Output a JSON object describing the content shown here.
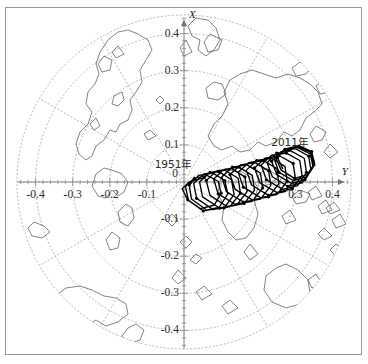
{
  "figure": {
    "type": "polar-motion-plot",
    "background": "#ffffff",
    "frame_color": "#9b9b9b",
    "grid_color": "#b9b9b9",
    "coast_color": "#555555",
    "data_color": "#000000",
    "axis_color": "#8a8a8a"
  },
  "axes": {
    "x_axis_label": "X",
    "y_axis_label": "Y",
    "origin_label": "0",
    "x_ticks_left": [
      "-0.4",
      "-0.3",
      "-0.2",
      "-0.1"
    ],
    "x_ticks_right": [
      "0.3",
      "0.4"
    ],
    "y_ticks_up": [
      "0.4",
      "0.3",
      "0.2",
      "0.1"
    ],
    "y_ticks_down": [
      "-0.1",
      "-0.2",
      "-0.3",
      "-0.4"
    ],
    "xlim": [
      -0.45,
      0.45
    ],
    "ylim": [
      -0.45,
      0.45
    ],
    "grid": "polar-dotted"
  },
  "annotations": [
    {
      "text": "1951年",
      "x": 0.02,
      "y": 0.045
    },
    {
      "text": "2011年",
      "x": 0.235,
      "y": 0.105
    }
  ],
  "chart_data": {
    "type": "line",
    "title": "",
    "xlabel": "X",
    "ylabel": "Y",
    "xlim": [
      -0.45,
      0.45
    ],
    "ylim": [
      -0.45,
      0.45
    ],
    "grid": true,
    "legend": "none",
    "series": [
      {
        "name": "polar motion 1951-2011",
        "start_label": "1951年",
        "end_label": "2011年",
        "points": [
          [
            0.055,
            0.012
          ],
          [
            0.015,
            0.001
          ],
          [
            -0.005,
            -0.018
          ],
          [
            0.01,
            -0.048
          ],
          [
            0.045,
            -0.072
          ],
          [
            0.082,
            -0.062
          ],
          [
            0.1,
            -0.03
          ],
          [
            0.092,
            0.002
          ],
          [
            0.062,
            0.018
          ],
          [
            0.028,
            0.01
          ],
          [
            0.004,
            -0.012
          ],
          [
            0.012,
            -0.05
          ],
          [
            0.052,
            -0.078
          ],
          [
            0.095,
            -0.068
          ],
          [
            0.118,
            -0.032
          ],
          [
            0.11,
            0.004
          ],
          [
            0.078,
            0.024
          ],
          [
            0.04,
            0.018
          ],
          [
            0.014,
            -0.008
          ],
          [
            0.02,
            -0.046
          ],
          [
            0.062,
            -0.076
          ],
          [
            0.108,
            -0.07
          ],
          [
            0.135,
            -0.034
          ],
          [
            0.128,
            0.006
          ],
          [
            0.094,
            0.028
          ],
          [
            0.054,
            0.022
          ],
          [
            0.026,
            -0.004
          ],
          [
            0.034,
            -0.044
          ],
          [
            0.078,
            -0.074
          ],
          [
            0.124,
            -0.066
          ],
          [
            0.152,
            -0.03
          ],
          [
            0.146,
            0.01
          ],
          [
            0.11,
            0.032
          ],
          [
            0.07,
            0.026
          ],
          [
            0.042,
            0.0
          ],
          [
            0.05,
            -0.04
          ],
          [
            0.096,
            -0.07
          ],
          [
            0.142,
            -0.062
          ],
          [
            0.17,
            -0.026
          ],
          [
            0.164,
            0.014
          ],
          [
            0.128,
            0.036
          ],
          [
            0.088,
            0.03
          ],
          [
            0.06,
            0.004
          ],
          [
            0.07,
            -0.036
          ],
          [
            0.116,
            -0.066
          ],
          [
            0.162,
            -0.058
          ],
          [
            0.19,
            -0.022
          ],
          [
            0.184,
            0.018
          ],
          [
            0.148,
            0.04
          ],
          [
            0.108,
            0.034
          ],
          [
            0.08,
            0.008
          ],
          [
            0.092,
            -0.032
          ],
          [
            0.138,
            -0.06
          ],
          [
            0.184,
            -0.052
          ],
          [
            0.212,
            -0.016
          ],
          [
            0.206,
            0.024
          ],
          [
            0.17,
            0.046
          ],
          [
            0.13,
            0.04
          ],
          [
            0.102,
            0.014
          ],
          [
            0.114,
            -0.026
          ],
          [
            0.16,
            -0.054
          ],
          [
            0.206,
            -0.046
          ],
          [
            0.234,
            -0.01
          ],
          [
            0.228,
            0.03
          ],
          [
            0.192,
            0.052
          ],
          [
            0.152,
            0.046
          ],
          [
            0.124,
            0.02
          ],
          [
            0.138,
            -0.02
          ],
          [
            0.184,
            -0.048
          ],
          [
            0.228,
            -0.04
          ],
          [
            0.256,
            -0.004
          ],
          [
            0.25,
            0.036
          ],
          [
            0.214,
            0.058
          ],
          [
            0.174,
            0.052
          ],
          [
            0.146,
            0.026
          ],
          [
            0.16,
            -0.014
          ],
          [
            0.206,
            -0.042
          ],
          [
            0.25,
            -0.034
          ],
          [
            0.278,
            0.002
          ],
          [
            0.272,
            0.042
          ],
          [
            0.236,
            0.064
          ],
          [
            0.196,
            0.058
          ],
          [
            0.168,
            0.032
          ],
          [
            0.182,
            -0.008
          ],
          [
            0.228,
            -0.036
          ],
          [
            0.272,
            -0.026
          ],
          [
            0.3,
            0.01
          ],
          [
            0.294,
            0.05
          ],
          [
            0.258,
            0.07
          ],
          [
            0.218,
            0.064
          ],
          [
            0.19,
            0.038
          ],
          [
            0.204,
            -0.002
          ],
          [
            0.25,
            -0.028
          ],
          [
            0.292,
            -0.018
          ],
          [
            0.318,
            0.018
          ],
          [
            0.312,
            0.058
          ],
          [
            0.276,
            0.078
          ],
          [
            0.236,
            0.072
          ],
          [
            0.208,
            0.046
          ],
          [
            0.222,
            0.006
          ],
          [
            0.266,
            -0.02
          ],
          [
            0.306,
            -0.01
          ],
          [
            0.33,
            0.026
          ],
          [
            0.324,
            0.064
          ],
          [
            0.288,
            0.084
          ],
          [
            0.25,
            0.078
          ],
          [
            0.224,
            0.052
          ],
          [
            0.238,
            0.014
          ],
          [
            0.28,
            -0.012
          ],
          [
            0.318,
            -0.002
          ],
          [
            0.342,
            0.032
          ],
          [
            0.336,
            0.07
          ],
          [
            0.3,
            0.09
          ],
          [
            0.262,
            0.082
          ],
          [
            0.236,
            0.056
          ],
          [
            0.25,
            0.02
          ],
          [
            0.29,
            -0.004
          ],
          [
            0.326,
            0.006
          ],
          [
            0.348,
            0.04
          ],
          [
            0.34,
            0.076
          ],
          [
            0.304,
            0.094
          ],
          [
            0.268,
            0.086
          ],
          [
            0.244,
            0.06
          ],
          [
            0.256,
            0.026
          ],
          [
            0.294,
            0.004
          ],
          [
            0.33,
            0.014
          ],
          [
            0.35,
            0.046
          ],
          [
            0.342,
            0.08
          ],
          [
            0.308,
            0.096
          ],
          [
            0.272,
            0.088
          ],
          [
            0.248,
            0.064
          ],
          [
            0.262,
            0.032
          ],
          [
            0.298,
            0.01
          ],
          [
            0.332,
            0.02
          ],
          [
            0.352,
            0.05
          ],
          [
            0.344,
            0.082
          ],
          [
            0.31,
            0.098
          ],
          [
            0.276,
            0.09
          ],
          [
            0.252,
            0.066
          ],
          [
            0.266,
            0.036
          ]
        ]
      }
    ]
  }
}
